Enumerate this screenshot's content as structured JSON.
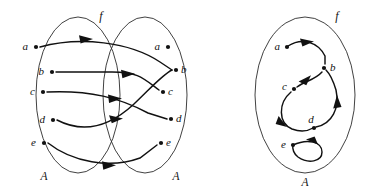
{
  "figure": {
    "background_color": "#ffffff",
    "ink_color": "#111111",
    "ellipse_color": "#2b2b2b"
  },
  "diagram_left": {
    "name": "bipartite-arrow-diagram",
    "function_label": "f",
    "domain_set_label": "A",
    "codomain_set_label": "A",
    "domain_elements": [
      {
        "label": "a",
        "x": 36,
        "y": 47
      },
      {
        "label": "b",
        "x": 52,
        "y": 72
      },
      {
        "label": "c",
        "x": 43,
        "y": 92
      },
      {
        "label": "d",
        "x": 53,
        "y": 120
      },
      {
        "label": "e",
        "x": 44,
        "y": 143
      }
    ],
    "codomain_elements": [
      {
        "label": "a",
        "x": 168,
        "y": 47
      },
      {
        "label": "b",
        "x": 176,
        "y": 70
      },
      {
        "label": "c",
        "x": 163,
        "y": 92
      },
      {
        "label": "d",
        "x": 171,
        "y": 119
      },
      {
        "label": "e",
        "x": 161,
        "y": 143
      }
    ],
    "mappings": [
      {
        "from": "a",
        "to": "b"
      },
      {
        "from": "b",
        "to": "c"
      },
      {
        "from": "c",
        "to": "d"
      },
      {
        "from": "d",
        "to": "b"
      },
      {
        "from": "e",
        "to": "e"
      }
    ]
  },
  "diagram_right": {
    "name": "directed-graph-diagram",
    "function_label": "f",
    "set_label": "A",
    "elements": [
      {
        "label": "a",
        "x": 284,
        "y": 47
      },
      {
        "label": "b",
        "x": 324,
        "y": 68
      },
      {
        "label": "c",
        "x": 293,
        "y": 88
      },
      {
        "label": "d",
        "x": 313,
        "y": 119
      },
      {
        "label": "e",
        "x": 289,
        "y": 145
      }
    ],
    "arcs": [
      {
        "from": "a",
        "to": "b"
      },
      {
        "from": "b",
        "to": "c"
      },
      {
        "from": "c",
        "to": "d"
      },
      {
        "from": "d",
        "to": "b"
      },
      {
        "from": "e",
        "to": "e",
        "self_loop": true
      }
    ]
  }
}
